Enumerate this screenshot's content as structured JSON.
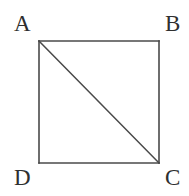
{
  "figure": {
    "background_color": "#ffffff",
    "stroke_color": "#4a4a4a",
    "label_color": "#2f2f2f",
    "stroke_width": 1.6,
    "canvas": {
      "width": 189,
      "height": 196
    },
    "square": {
      "left": 39,
      "top": 41,
      "right": 159,
      "bottom": 163,
      "width": 120,
      "height": 122
    },
    "vertices": [
      {
        "name": "A",
        "label": "A",
        "corner": "top-left",
        "x": 39,
        "y": 41
      },
      {
        "name": "B",
        "label": "B",
        "corner": "top-right",
        "x": 159,
        "y": 41
      },
      {
        "name": "C",
        "label": "C",
        "corner": "bottom-right",
        "x": 159,
        "y": 163
      },
      {
        "name": "D",
        "label": "D",
        "corner": "bottom-left",
        "x": 39,
        "y": 163
      }
    ],
    "edges": [
      {
        "name": "AB",
        "from": "A",
        "to": "B"
      },
      {
        "name": "BC",
        "from": "B",
        "to": "C"
      },
      {
        "name": "CD",
        "from": "C",
        "to": "D"
      },
      {
        "name": "DA",
        "from": "D",
        "to": "A"
      }
    ],
    "diagonal": {
      "name": "AC",
      "from": "A",
      "to": "C"
    }
  }
}
